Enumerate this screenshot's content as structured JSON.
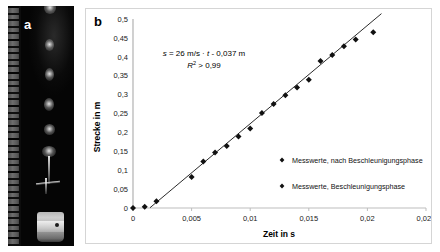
{
  "figure": {
    "panel_a": {
      "letter": "a",
      "description": "stroboscopic-photograph-of-projectile-with-ruler"
    },
    "panel_b": {
      "letter": "b"
    }
  },
  "chart_data": {
    "type": "scatter",
    "title": "",
    "xlabel": "Zeit in s",
    "ylabel": "Strecke in m",
    "xlim": [
      0,
      0.025
    ],
    "ylim": [
      0,
      0.5
    ],
    "xticks": [
      0,
      0.005,
      0.01,
      0.015,
      0.02,
      0.025
    ],
    "xtick_labels": [
      "0",
      "0,005",
      "0,01",
      "0,015",
      "0,02",
      "0,025"
    ],
    "yticks": [
      0,
      0.05,
      0.1,
      0.15,
      0.2,
      0.25,
      0.3,
      0.35,
      0.4,
      0.45,
      0.5
    ],
    "ytick_labels": [
      "0",
      "0,05",
      "0,1",
      "0,15",
      "0,2",
      "0,25",
      "0,3",
      "0,35",
      "0,4",
      "0,45",
      "0,5"
    ],
    "grid": false,
    "legend_position": "center-right",
    "annotations": {
      "equation": "s = 26 m/s · t - 0,037 m",
      "equation_parts": {
        "s": "s",
        "rest": " = 26 m/s · ",
        "t": "t",
        "tail": " - 0,037 m"
      },
      "r_squared": "R² > 0,99",
      "r_squared_parts": {
        "r": "R",
        "sup": "2",
        "tail": " > 0,99"
      }
    },
    "legend": [
      {
        "label": "Messwerte, nach Beschleunigungsphase",
        "marker": "diamond",
        "color": "#111111"
      },
      {
        "label": "Messwerte, Beschleunigungsphase",
        "marker": "diamond",
        "color": "#111111"
      }
    ],
    "series": [
      {
        "name": "Messwerte, Beschleunigungsphase",
        "marker": "diamond",
        "color": "#111111",
        "points": [
          {
            "x": 0.0,
            "y": 0.0
          },
          {
            "x": 0.001,
            "y": 0.003
          },
          {
            "x": 0.002,
            "y": 0.018
          }
        ]
      },
      {
        "name": "Messwerte, nach Beschleunigungsphase",
        "marker": "diamond",
        "color": "#111111",
        "points": [
          {
            "x": 0.005,
            "y": 0.082
          },
          {
            "x": 0.006,
            "y": 0.123
          },
          {
            "x": 0.007,
            "y": 0.147
          },
          {
            "x": 0.008,
            "y": 0.164
          },
          {
            "x": 0.009,
            "y": 0.189
          },
          {
            "x": 0.01,
            "y": 0.21
          },
          {
            "x": 0.011,
            "y": 0.251
          },
          {
            "x": 0.012,
            "y": 0.275
          },
          {
            "x": 0.013,
            "y": 0.298
          },
          {
            "x": 0.014,
            "y": 0.319
          },
          {
            "x": 0.015,
            "y": 0.339
          },
          {
            "x": 0.016,
            "y": 0.389
          },
          {
            "x": 0.017,
            "y": 0.405
          },
          {
            "x": 0.018,
            "y": 0.428
          },
          {
            "x": 0.019,
            "y": 0.446
          },
          {
            "x": 0.0205,
            "y": 0.465
          }
        ]
      }
    ],
    "fit_line": {
      "name": "linear-regression-line",
      "slope": 26,
      "intercept": -0.037,
      "x_start": 0.00145,
      "x_end": 0.0212,
      "color": "#2b2b2b"
    }
  }
}
